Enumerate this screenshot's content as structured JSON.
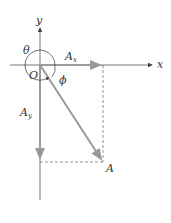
{
  "diagram": {
    "labels": {
      "y_axis": "y",
      "x_axis": "x",
      "origin": "O",
      "theta": "θ",
      "phi": "ϕ",
      "ax_main": "A",
      "ax_sub": "x",
      "ay_main": "A",
      "ay_sub": "y",
      "vector_tip": "A"
    },
    "colors": {
      "axis": "#555555",
      "vector": "#9a9a9a",
      "dashed": "#666666",
      "text": "#333333"
    },
    "geometry": {
      "origin": [
        40,
        65
      ],
      "tip": [
        103,
        162
      ],
      "circle_radius": 15
    }
  }
}
